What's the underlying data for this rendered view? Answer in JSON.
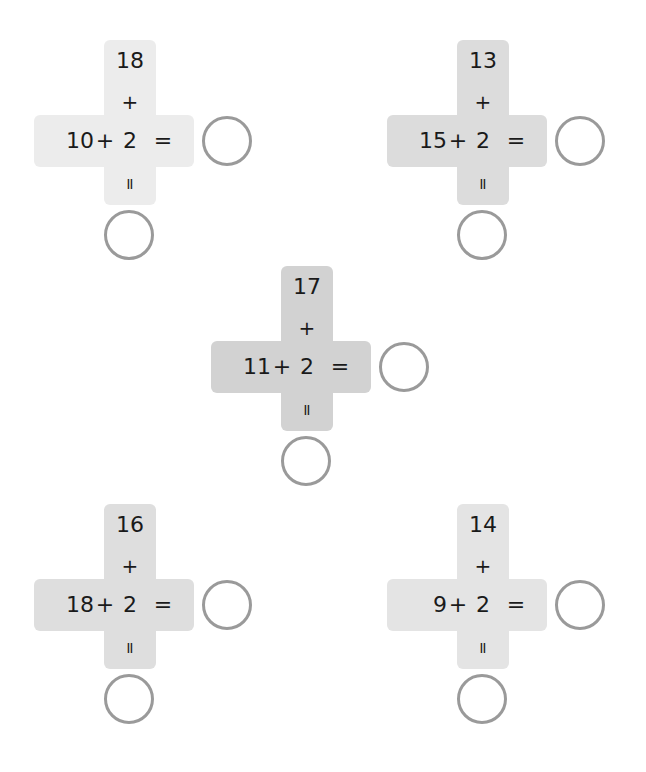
{
  "puzzles": [
    {
      "top": "18",
      "left": "10",
      "middle": "2",
      "plus": "+",
      "equals": "=",
      "color": "#ececec",
      "x": 34,
      "y": 30
    },
    {
      "top": "13",
      "left": "15",
      "middle": "2",
      "plus": "+",
      "equals": "=",
      "color": "#dcdcdc",
      "x": 387,
      "y": 30
    },
    {
      "top": "17",
      "left": "11",
      "middle": "2",
      "plus": "+",
      "equals": "=",
      "color": "#d2d2d2",
      "x": 211,
      "y": 256
    },
    {
      "top": "16",
      "left": "18",
      "middle": "2",
      "plus": "+",
      "equals": "=",
      "color": "#dedede",
      "x": 34,
      "y": 494
    },
    {
      "top": "14",
      "left": "9",
      "middle": "2",
      "plus": "+",
      "equals": "=",
      "color": "#e4e4e4",
      "x": 387,
      "y": 494
    }
  ]
}
